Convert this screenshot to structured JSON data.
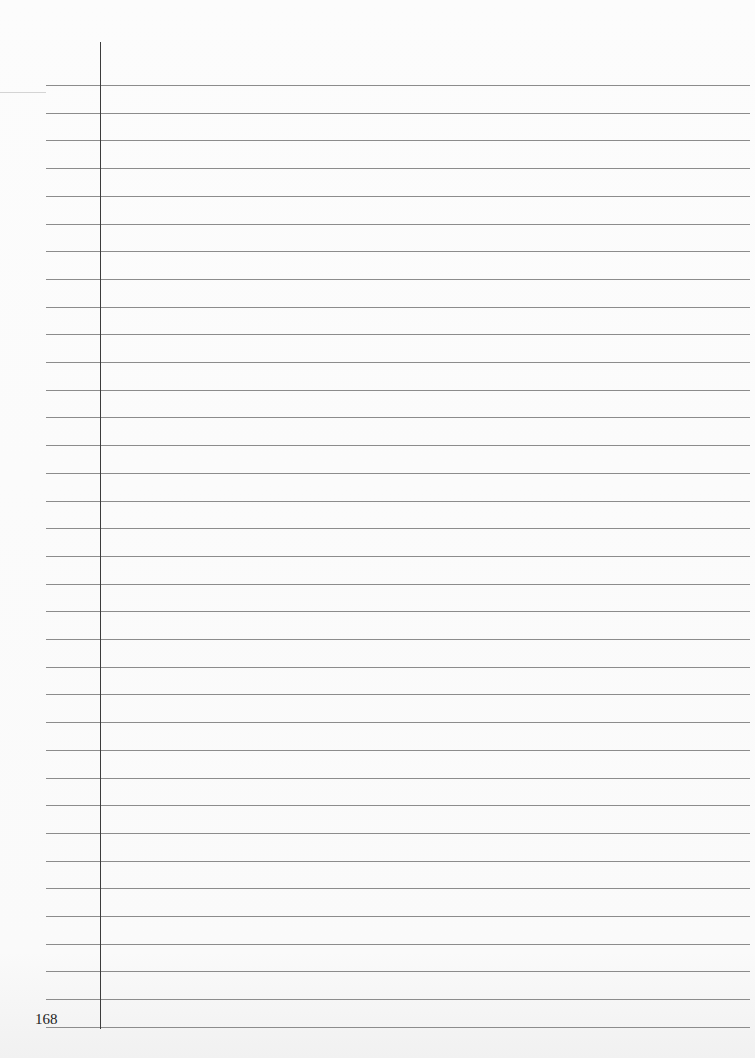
{
  "page": {
    "type": "ruled-notebook-page",
    "page_number": "168",
    "background_color": "#fbfbfb",
    "rule_color": "#8c8c8c",
    "margin_line_color": "#3c3c3c",
    "rule_count": 35,
    "first_rule_y": 85,
    "rule_spacing": 27.7,
    "rule_left": 46,
    "rule_right": 750,
    "margin_line_x": 100,
    "margin_line_top": 42,
    "margin_line_bottom": 1029,
    "content": ""
  }
}
